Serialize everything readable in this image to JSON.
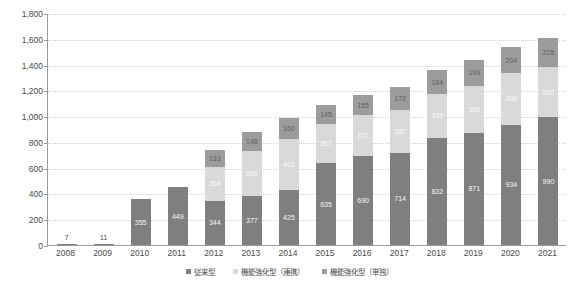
{
  "chart_data": {
    "type": "bar",
    "stacked": true,
    "title": "",
    "xlabel": "",
    "ylabel": "",
    "ylim": [
      0,
      1800
    ],
    "ytick_step": 200,
    "grid": true,
    "legend_position": "bottom",
    "categories": [
      "2008",
      "2009",
      "2010",
      "2011",
      "2012",
      "2013",
      "2014",
      "2015",
      "2016",
      "2017",
      "2018",
      "2019",
      "2020",
      "2021"
    ],
    "ytick_labels": [
      "0",
      "200",
      "400",
      "600",
      "800",
      "1,000",
      "1,200",
      "1,400",
      "1,600",
      "1,800"
    ],
    "series": [
      {
        "name": "従来型",
        "color": "#7f7f7f",
        "values": [
          7,
          11,
          355,
          449,
          344,
          377,
          425,
          635,
          690,
          714,
          832,
          871,
          934,
          990
        ]
      },
      {
        "name": "機能強化型（連携）",
        "color": "#d9d9d9",
        "values": [
          0,
          0,
          0,
          0,
          264,
          350,
          401,
          307,
          317,
          337,
          339,
          366,
          398,
          392
        ]
      },
      {
        "name": "機能強化型（単独）",
        "color": "#9c9c9c",
        "values": [
          0,
          0,
          0,
          0,
          133,
          148,
          160,
          145,
          155,
          172,
          184,
          196,
          204,
          225
        ]
      }
    ],
    "totals": [
      7,
      11,
      355,
      449,
      741,
      875,
      986,
      1087,
      1162,
      1223,
      1355,
      1433,
      1536,
      1607
    ],
    "point_labels": {
      "2008": [
        "7"
      ],
      "2009": [
        "11"
      ],
      "2010": [
        "355"
      ],
      "2011": [
        "449"
      ],
      "2012": [
        "344",
        "264",
        "133"
      ],
      "2013": [
        "377",
        "350",
        "148"
      ],
      "2014": [
        "425",
        "401",
        "160"
      ],
      "2015": [
        "635",
        "307",
        "145"
      ],
      "2016": [
        "690",
        "317",
        "155"
      ],
      "2017": [
        "714",
        "337",
        "172"
      ],
      "2018": [
        "832",
        "339",
        "184"
      ],
      "2019": [
        "871",
        "366",
        "196"
      ],
      "2020": [
        "934",
        "398",
        "204"
      ],
      "2021": [
        "990",
        "392",
        "225"
      ]
    }
  },
  "legend": {
    "items": [
      {
        "label": "従来型",
        "color": "#7f7f7f"
      },
      {
        "label": "機能強化型（連携）",
        "color": "#d9d9d9"
      },
      {
        "label": "機能強化型（単独）",
        "color": "#9c9c9c"
      }
    ]
  },
  "axis": {
    "y_min_label": "0",
    "y_max_label": "1,800"
  }
}
